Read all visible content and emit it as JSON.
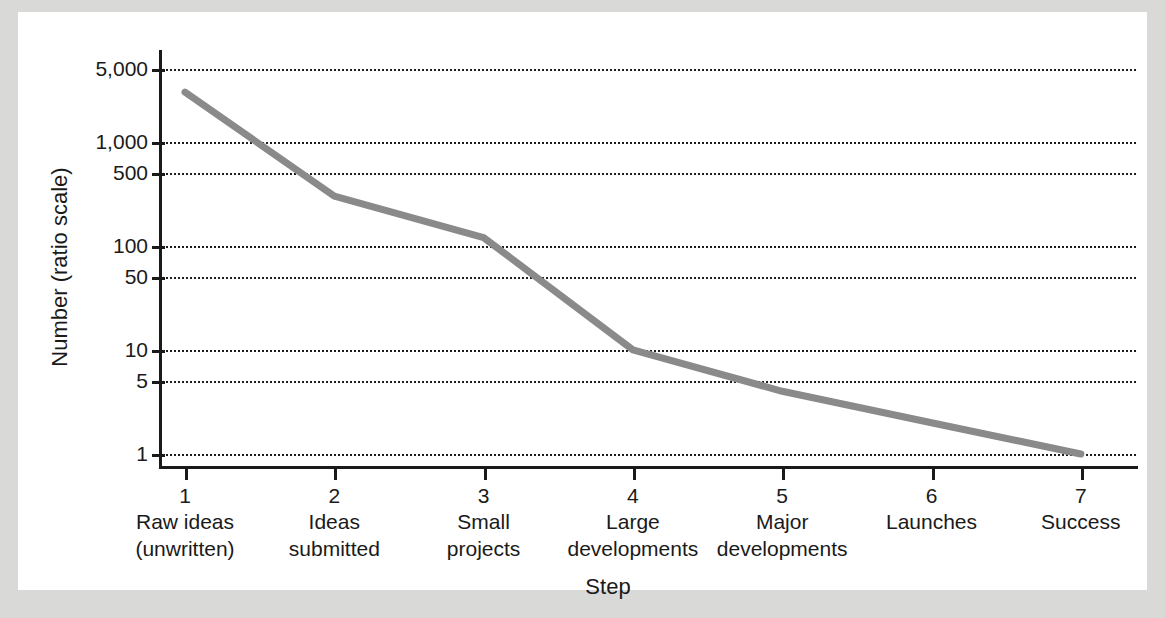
{
  "chart_data": {
    "type": "line",
    "title": "",
    "xlabel": "Step",
    "ylabel": "Number (ratio scale)",
    "yscale": "log",
    "ylim": [
      1,
      5000
    ],
    "grid": true,
    "legend": "none",
    "x": [
      1,
      2,
      3,
      4,
      5,
      6,
      7
    ],
    "categories": [
      "Raw ideas (unwritten)",
      "Ideas submitted",
      "Small projects",
      "Large developments",
      "Major developments",
      "Launches",
      "Success"
    ],
    "values": [
      3000,
      300,
      120,
      10,
      4,
      2,
      1
    ],
    "y_tick_values": [
      5000,
      1000,
      500,
      100,
      50,
      10,
      5,
      1
    ],
    "y_tick_labels": [
      "5,000",
      "1,000",
      "500",
      "100",
      "50",
      "10",
      "5",
      "1"
    ],
    "x_tick_labels": [
      "1",
      "2",
      "3",
      "4",
      "5",
      "6",
      "7"
    ],
    "series": [
      {
        "name": "Number at each step",
        "values": [
          3000,
          300,
          120,
          10,
          4,
          2,
          1
        ],
        "color": "#8a8a8a"
      }
    ]
  },
  "axes": {
    "y_title": "Number (ratio scale)",
    "x_title": "Step",
    "y_ticks": [
      {
        "label": "5,000",
        "value": 5000
      },
      {
        "label": "1,000",
        "value": 1000
      },
      {
        "label": "500",
        "value": 500
      },
      {
        "label": "100",
        "value": 100
      },
      {
        "label": "50",
        "value": 50
      },
      {
        "label": "10",
        "value": 10
      },
      {
        "label": "5",
        "value": 5
      },
      {
        "label": "1",
        "value": 1
      }
    ],
    "x_ticks": [
      {
        "number": "1",
        "line1": "Raw ideas",
        "line2": "(unwritten)"
      },
      {
        "number": "2",
        "line1": "Ideas",
        "line2": "submitted"
      },
      {
        "number": "3",
        "line1": "Small",
        "line2": "projects"
      },
      {
        "number": "4",
        "line1": "Large",
        "line2": "developments"
      },
      {
        "number": "5",
        "line1": "Major",
        "line2": "developments"
      },
      {
        "number": "6",
        "line1": "Launches",
        "line2": ""
      },
      {
        "number": "7",
        "line1": "Success",
        "line2": ""
      }
    ]
  },
  "colors": {
    "series_line": "#8a8a8a",
    "axis": "#1a1a1a",
    "gridline": "#1c1c1c",
    "panel_background": "#ffffff",
    "page_background": "#d9d9d7"
  }
}
